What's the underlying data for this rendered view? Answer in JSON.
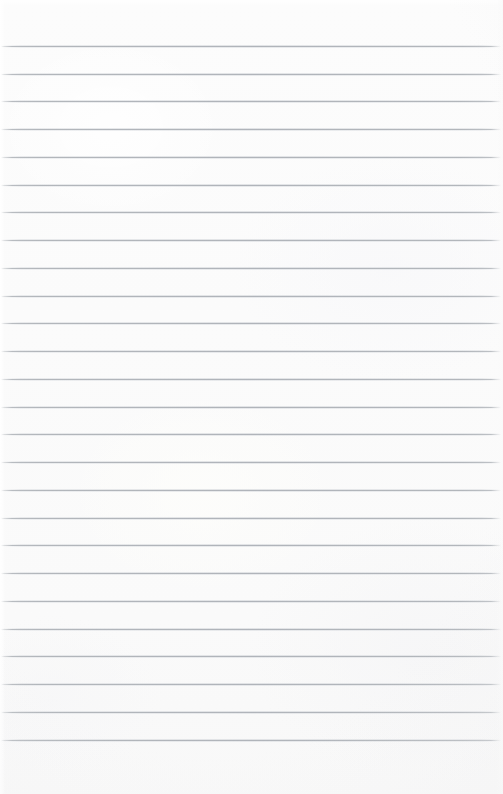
{
  "document": {
    "kind": "lined-paper-scan",
    "title": "",
    "body_text": "",
    "page_width": 503,
    "page_height": 794,
    "paper_color": "#fbfbfb",
    "rule_color": "#b0b4ba",
    "rule_count": 26,
    "first_rule_y": 46,
    "rule_spacing": 27.75,
    "rule_left": 1,
    "rule_right": 501,
    "has_margin_rule": false,
    "has_holes": false,
    "rules": [
      {
        "index": 1,
        "y": 46,
        "x_start": 1,
        "x_end": 501
      },
      {
        "index": 2,
        "y": 74,
        "x_start": 1,
        "x_end": 501
      },
      {
        "index": 3,
        "y": 101,
        "x_start": 1,
        "x_end": 501
      },
      {
        "index": 4,
        "y": 129,
        "x_start": 1,
        "x_end": 501
      },
      {
        "index": 5,
        "y": 157,
        "x_start": 1,
        "x_end": 501
      },
      {
        "index": 6,
        "y": 185,
        "x_start": 1,
        "x_end": 501
      },
      {
        "index": 7,
        "y": 212,
        "x_start": 1,
        "x_end": 501
      },
      {
        "index": 8,
        "y": 240,
        "x_start": 1,
        "x_end": 501
      },
      {
        "index": 9,
        "y": 268,
        "x_start": 1,
        "x_end": 501
      },
      {
        "index": 10,
        "y": 296,
        "x_start": 1,
        "x_end": 501
      },
      {
        "index": 11,
        "y": 323,
        "x_start": 1,
        "x_end": 501
      },
      {
        "index": 12,
        "y": 351,
        "x_start": 1,
        "x_end": 501
      },
      {
        "index": 13,
        "y": 379,
        "x_start": 1,
        "x_end": 501
      },
      {
        "index": 14,
        "y": 407,
        "x_start": 1,
        "x_end": 501
      },
      {
        "index": 15,
        "y": 434,
        "x_start": 1,
        "x_end": 501
      },
      {
        "index": 16,
        "y": 462,
        "x_start": 1,
        "x_end": 501
      },
      {
        "index": 17,
        "y": 490,
        "x_start": 1,
        "x_end": 501
      },
      {
        "index": 18,
        "y": 518,
        "x_start": 1,
        "x_end": 501
      },
      {
        "index": 19,
        "y": 545,
        "x_start": 1,
        "x_end": 501
      },
      {
        "index": 20,
        "y": 573,
        "x_start": 1,
        "x_end": 501
      },
      {
        "index": 21,
        "y": 601,
        "x_start": 1,
        "x_end": 501
      },
      {
        "index": 22,
        "y": 629,
        "x_start": 1,
        "x_end": 501
      },
      {
        "index": 23,
        "y": 656,
        "x_start": 1,
        "x_end": 501
      },
      {
        "index": 24,
        "y": 684,
        "x_start": 1,
        "x_end": 501
      },
      {
        "index": 25,
        "y": 712,
        "x_start": 1,
        "x_end": 501
      },
      {
        "index": 26,
        "y": 740,
        "x_start": 1,
        "x_end": 501
      }
    ]
  }
}
